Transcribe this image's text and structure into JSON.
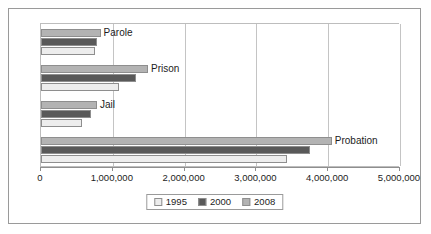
{
  "chart_data": {
    "type": "bar",
    "orientation": "horizontal",
    "title": "",
    "xlabel": "",
    "ylabel": "",
    "categories": [
      "Parole",
      "Prison",
      "Jail",
      "Probation"
    ],
    "series": [
      {
        "name": "1995",
        "color": "#ededed",
        "values": [
          750000,
          1080000,
          570000,
          3420000
        ]
      },
      {
        "name": "2000",
        "color": "#595959",
        "values": [
          780000,
          1320000,
          700000,
          3750000
        ]
      },
      {
        "name": "2008",
        "color": "#b3b3b3",
        "values": [
          830000,
          1490000,
          780000,
          4050000
        ]
      }
    ],
    "series_draw_order": [
      "2008",
      "2000",
      "1995"
    ],
    "xlim": [
      0,
      5000000
    ],
    "xticks": [
      0,
      1000000,
      2000000,
      3000000,
      4000000,
      5000000
    ],
    "xtick_labels": [
      "0",
      "1,000,000",
      "2,000,000",
      "3,000,000",
      "4,000,000",
      "5,000,000"
    ],
    "grid": true,
    "grid_axis": "x",
    "legend": {
      "position": "bottom",
      "entries": [
        "1995",
        "2000",
        "2008"
      ]
    }
  }
}
